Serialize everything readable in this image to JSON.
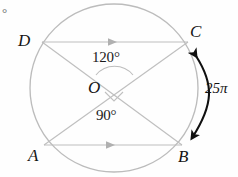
{
  "figure": {
    "type": "circle-geometry-diagram",
    "width": 238,
    "height": 177,
    "background_color": "#fefefe",
    "stroke_color": "#b9b9b9",
    "label_color": "#151515",
    "corner_artifact": "°"
  },
  "circle": {
    "name": "main-circle",
    "center_label": "O",
    "cx": 114,
    "cy": 88,
    "r": 84
  },
  "vertices": [
    {
      "label": "D",
      "x": 42,
      "y": 42,
      "label_x": 18,
      "label_y": 32
    },
    {
      "label": "C",
      "x": 188,
      "y": 42,
      "label_x": 190,
      "label_y": 25
    },
    {
      "label": "A",
      "x": 44,
      "y": 145,
      "label_x": 28,
      "label_y": 148
    },
    {
      "label": "B",
      "x": 182,
      "y": 145,
      "label_x": 180,
      "label_y": 150
    }
  ],
  "center": {
    "label": "O",
    "label_x": 89,
    "label_y": 80
  },
  "chords": [
    {
      "name": "chord-DC",
      "from": "D",
      "to": "C",
      "marker": "single-arrow",
      "x1": 42,
      "y1": 42,
      "x2": 188,
      "y2": 42
    },
    {
      "name": "chord-AB",
      "from": "A",
      "to": "B",
      "marker": "single-arrow",
      "x1": 44,
      "y1": 145,
      "x2": 182,
      "y2": 145
    }
  ],
  "diagonals": [
    {
      "name": "diagonal-DB",
      "from": "D",
      "to": "B",
      "x1": 42,
      "y1": 42,
      "x2": 182,
      "y2": 145
    },
    {
      "name": "diagonal-AC",
      "from": "A",
      "to": "C",
      "x1": 44,
      "y1": 145,
      "x2": 188,
      "y2": 42
    }
  ],
  "angles": [
    {
      "name": "angle-DOC",
      "value": "120°",
      "marker": "arc",
      "label_x": 94,
      "label_y": 52,
      "position": "above-center"
    },
    {
      "name": "angle-AOB",
      "value": "90°",
      "marker": "right-angle-square",
      "label_x": 97,
      "label_y": 110,
      "position": "below-center"
    }
  ],
  "arc_annotation": {
    "name": "arc-length-CB",
    "label": "25π",
    "label_x": 206,
    "label_y": 82,
    "arrow_style": "double-headed-curved",
    "from_vertex": "C",
    "to_vertex": "B",
    "color": "#111111"
  }
}
